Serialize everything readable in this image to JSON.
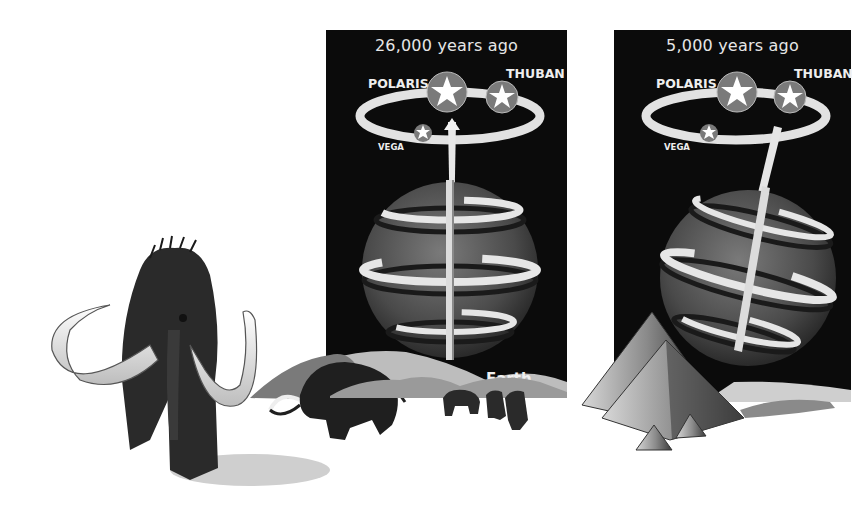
{
  "illustration": {
    "subject": "Precession of Earth's axis — pole star over time",
    "panels": [
      {
        "title": "26,000 years ago",
        "stars": {
          "polaris": "POLARIS",
          "thuban": "THUBAN",
          "vega": "VEGA"
        },
        "earth_label": "Earth",
        "scene": "woolly mammoths and woolly rhinoceros / yaks on icy plain"
      },
      {
        "title": "5,000 years ago",
        "stars": {
          "polaris": "POLARIS",
          "thuban": "THUBAN",
          "vega": "VEGA"
        },
        "scene": "Egyptian pyramids in desert"
      }
    ],
    "colors": {
      "background": "#ffffff",
      "panel": "#0b0b0b",
      "text": "#eeeeee",
      "globe": "#5a5a5a",
      "band": "#e8e8e8"
    }
  }
}
